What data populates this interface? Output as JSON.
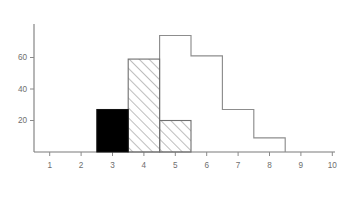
{
  "chart_data": {
    "type": "bar",
    "title": "",
    "subtitle": "",
    "xlabel": "",
    "ylabel": "",
    "xlim": [
      0.5,
      10.5
    ],
    "ylim": [
      0,
      80
    ],
    "grid": false,
    "legend": null,
    "x_ticks": [
      1,
      2,
      3,
      4,
      5,
      6,
      7,
      8,
      9,
      10
    ],
    "x_tick_labels": [
      "1",
      "2",
      "3",
      "4",
      "5",
      "6",
      "7",
      "8",
      "9",
      "10"
    ],
    "y_ticks": [
      20,
      40,
      60
    ],
    "y_tick_labels": [
      "20",
      "40",
      "60"
    ],
    "bin_width": 1,
    "categories": [
      "3",
      "4",
      "5",
      "6",
      "7",
      "8"
    ],
    "series": [
      {
        "name": "outline-histogram",
        "style": "outline",
        "bins": [
          {
            "x_center": 5,
            "x_start": 4.5,
            "x_end": 5.5,
            "value": 74
          },
          {
            "x_center": 6,
            "x_start": 5.5,
            "x_end": 6.5,
            "value": 61
          },
          {
            "x_center": 7,
            "x_start": 6.5,
            "x_end": 7.5,
            "value": 27
          },
          {
            "x_center": 8,
            "x_start": 7.5,
            "x_end": 8.5,
            "value": 9
          }
        ]
      },
      {
        "name": "hatched-region",
        "style": "diagonal-hatch",
        "bins": [
          {
            "x_center": 4,
            "x_start": 3.5,
            "x_end": 4.5,
            "value": 59
          },
          {
            "x_center": 5,
            "x_start": 4.5,
            "x_end": 5.5,
            "value": 20
          }
        ]
      },
      {
        "name": "solid-black-bar",
        "style": "solid-fill",
        "bins": [
          {
            "x_center": 3,
            "x_start": 2.5,
            "x_end": 3.5,
            "value": 27
          }
        ]
      }
    ],
    "colors": {
      "solid_fill": "#000000",
      "hatch_stroke": "#6f6f6f",
      "outline_stroke": "#8d8d8d",
      "axis": "#7a7a7a",
      "tick_label": "#6e6e6e",
      "background": "#ffffff"
    }
  }
}
